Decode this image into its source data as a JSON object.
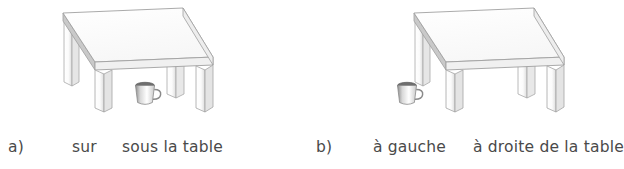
{
  "document": {
    "language": "fr",
    "kind": "preposition-illustration-worksheet",
    "background_color": "#ffffff",
    "text_color": "#4a4a4a"
  },
  "figures": [
    {
      "id": "a",
      "label": "a)",
      "terms": [
        "sur",
        "sous la table"
      ],
      "scene": {
        "objects": [
          "table",
          "cup"
        ],
        "cup_position": "under-the-table",
        "table_color": "#ffffff",
        "outline_color": "#9a9a9a",
        "shade_color": "#cfcfcf"
      }
    },
    {
      "id": "b",
      "label": "b)",
      "terms": [
        "à gauche",
        "à droite de la table"
      ],
      "scene": {
        "objects": [
          "table",
          "cup"
        ],
        "cup_position": "left-of-the-table",
        "table_color": "#ffffff",
        "outline_color": "#9a9a9a",
        "shade_color": "#cfcfcf"
      }
    }
  ]
}
